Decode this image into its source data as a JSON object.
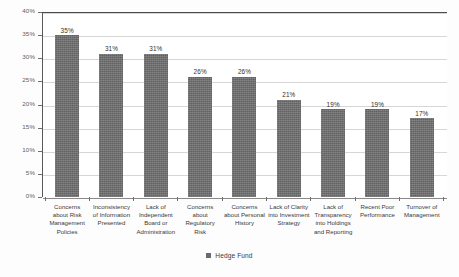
{
  "chart_data": {
    "type": "bar",
    "title": "",
    "subtitle": "",
    "xlabel": "",
    "ylabel": "",
    "ylim": [
      0,
      40
    ],
    "ytick_step": 5,
    "grid": true,
    "legend_position": "bottom",
    "value_suffix": "%",
    "categories": [
      "Concerns about Risk Management Policies",
      "Inconsistency of Information Presented",
      "Lack of Independent Board or Administration",
      "Concerns about Regulatory Risk",
      "Concerns about Personal History",
      "Lack of Clarity into Investment Strategy",
      "Lack of Transparency into Holdings and Reporting",
      "Recent Poor Performance",
      "Turnover of Management"
    ],
    "values": [
      35,
      31,
      31,
      26,
      26,
      21,
      19,
      19,
      17
    ],
    "value_labels": [
      "35%",
      "31%",
      "31%",
      "26%",
      "26%",
      "21%",
      "19%",
      "19%",
      "17%"
    ],
    "ytick_labels": [
      "0%",
      "5%",
      "10%",
      "15%",
      "20%",
      "25%",
      "30%",
      "35%",
      "40%"
    ],
    "series": [
      {
        "name": "Hedge Fund",
        "color": "#6b6b6b",
        "values": [
          35,
          31,
          31,
          26,
          26,
          21,
          19,
          19,
          17
        ]
      }
    ],
    "legend": [
      {
        "label": "Hedge Fund",
        "color": "#6b6b6b"
      }
    ]
  },
  "colors": {
    "bar": "#6b6b6b",
    "gridline": "#d6d6d6",
    "axis": "#5a5a5a",
    "frame_top": "#4a4a4a",
    "text": "#3a3a3a",
    "tick_text": "#5c5c5c",
    "background": "#fdfdfd",
    "plot_background": "#ffffff"
  }
}
